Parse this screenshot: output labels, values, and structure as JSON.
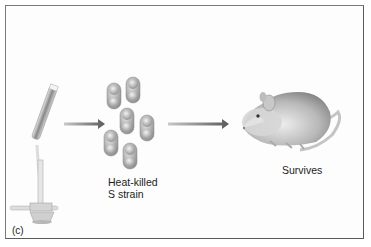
{
  "figure": {
    "panel_label": "(c)",
    "stages": [
      {
        "name": "bunsen-burner-with-test-tube"
      },
      {
        "name": "bacteria",
        "label_line1": "Heat-killed",
        "label_line2": "S strain"
      },
      {
        "name": "mouse",
        "label": "Survives"
      }
    ],
    "colors": {
      "border": "#7a7a7a",
      "arrow": "#6a6a6a",
      "bacteria": "#a8a8a8",
      "mouse_body": "#9a9a9a",
      "text": "#1c1c1c"
    }
  }
}
